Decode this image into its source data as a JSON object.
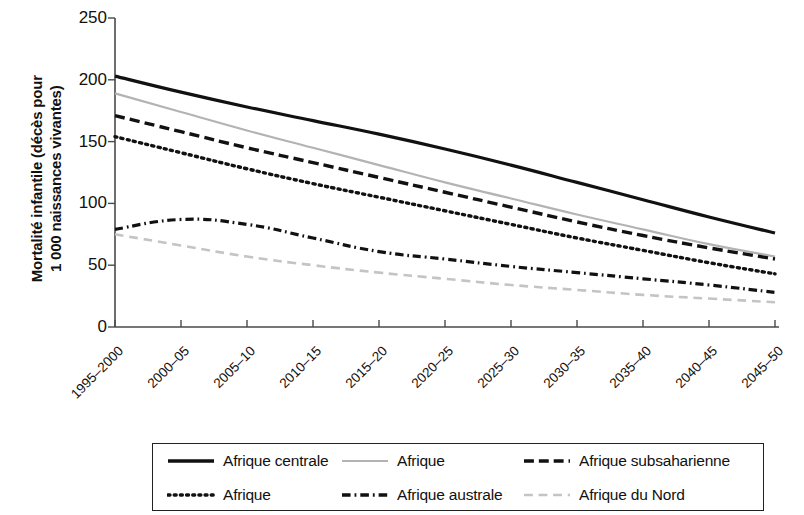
{
  "chart_data": {
    "type": "line",
    "title": "",
    "xlabel": "",
    "ylabel": "Mortalité infantile (décès pour\n1 000 naissances vivantes)",
    "ylim": [
      0,
      250
    ],
    "yticks": [
      0,
      50,
      100,
      150,
      200,
      250
    ],
    "grid": false,
    "legend_position": "bottom",
    "categories": [
      "1995–2000",
      "2000–05",
      "2005–10",
      "2010–15",
      "2015–20",
      "2020–25",
      "2025–30",
      "2030–35",
      "2035–40",
      "2040–45",
      "2045–50"
    ],
    "series": [
      {
        "name": "Afrique centrale",
        "style": "solid",
        "color": "#111111",
        "width": 3.2,
        "values": [
          203,
          190,
          178,
          167,
          156,
          144,
          131,
          117,
          103,
          89,
          76
        ]
      },
      {
        "name": "Afrique",
        "style": "solid-grey",
        "color": "#b3b3b3",
        "width": 2.2,
        "values": [
          189,
          174,
          159,
          145,
          131,
          117,
          104,
          91,
          79,
          67,
          57
        ]
      },
      {
        "name": "Afrique subsaharienne",
        "style": "dashed",
        "color": "#111111",
        "width": 3.4,
        "values": [
          171,
          158,
          145,
          133,
          121,
          109,
          97,
          85,
          74,
          64,
          55
        ]
      },
      {
        "name": "Afrique",
        "style": "dotted",
        "color": "#111111",
        "width": 3.4,
        "values": [
          154,
          141,
          128,
          116,
          105,
          94,
          83,
          72,
          62,
          52,
          43
        ]
      },
      {
        "name": "Afrique australe",
        "style": "dash-dot",
        "color": "#111111",
        "width": 3.2,
        "values": [
          79,
          87,
          83,
          72,
          61,
          55,
          49,
          44,
          39,
          34,
          28
        ]
      },
      {
        "name": "Afrique du Nord",
        "style": "dashed-grey",
        "color": "#c4c4c4",
        "width": 2.6,
        "values": [
          75,
          66,
          57,
          50,
          44,
          39,
          34,
          30,
          26,
          23,
          20
        ]
      }
    ]
  },
  "axis": {
    "y_title": "Mortalité infantile (décès pour\n1 000 naissances vivantes)",
    "y_tick_labels": [
      "250",
      "200",
      "150",
      "100",
      "50",
      "0"
    ],
    "x_tick_labels": [
      "1995–2000",
      "2000–05",
      "2005–10",
      "2010–15",
      "2015–20",
      "2020–25",
      "2025–30",
      "2030–35",
      "2035–40",
      "2040–45",
      "2045–50"
    ]
  },
  "legend": {
    "entries": [
      {
        "label": "Afrique centrale",
        "style": "solid",
        "color": "#111111"
      },
      {
        "label": "Afrique",
        "style": "solid-grey",
        "color": "#b3b3b3"
      },
      {
        "label": "Afrique subsaharienne",
        "style": "dashed",
        "color": "#111111"
      },
      {
        "label": "Afrique",
        "style": "dotted",
        "color": "#111111"
      },
      {
        "label": "Afrique australe",
        "style": "dash-dot",
        "color": "#111111"
      },
      {
        "label": "Afrique du Nord",
        "style": "dashed-grey",
        "color": "#c4c4c4"
      }
    ]
  }
}
